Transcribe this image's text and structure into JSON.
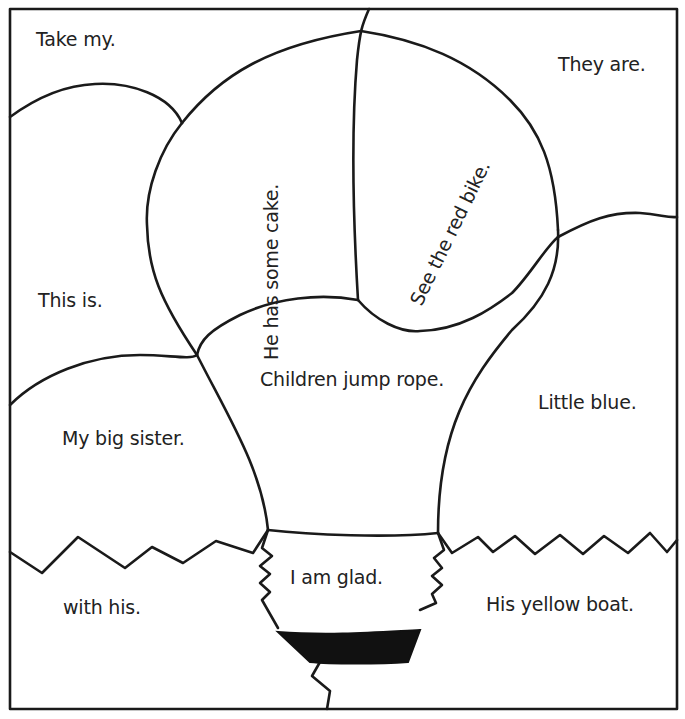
{
  "puzzle": {
    "border_color": "#1a1a1a",
    "background": "#ffffff",
    "regions": [
      {
        "id": "take-my",
        "text": "Take my."
      },
      {
        "id": "they-are",
        "text": "They are."
      },
      {
        "id": "he-has-some-cake",
        "text": "He has some cake."
      },
      {
        "id": "see-the-red-bike",
        "text": "See the red bike."
      },
      {
        "id": "this-is",
        "text": "This is."
      },
      {
        "id": "children-jump-rope",
        "text": "Children jump rope."
      },
      {
        "id": "little-blue",
        "text": "Little blue."
      },
      {
        "id": "my-big-sister",
        "text": "My big sister."
      },
      {
        "id": "i-am-glad",
        "text": "I am glad."
      },
      {
        "id": "with-his",
        "text": "with his."
      },
      {
        "id": "his-yellow-boat",
        "text": "His yellow boat."
      }
    ]
  }
}
